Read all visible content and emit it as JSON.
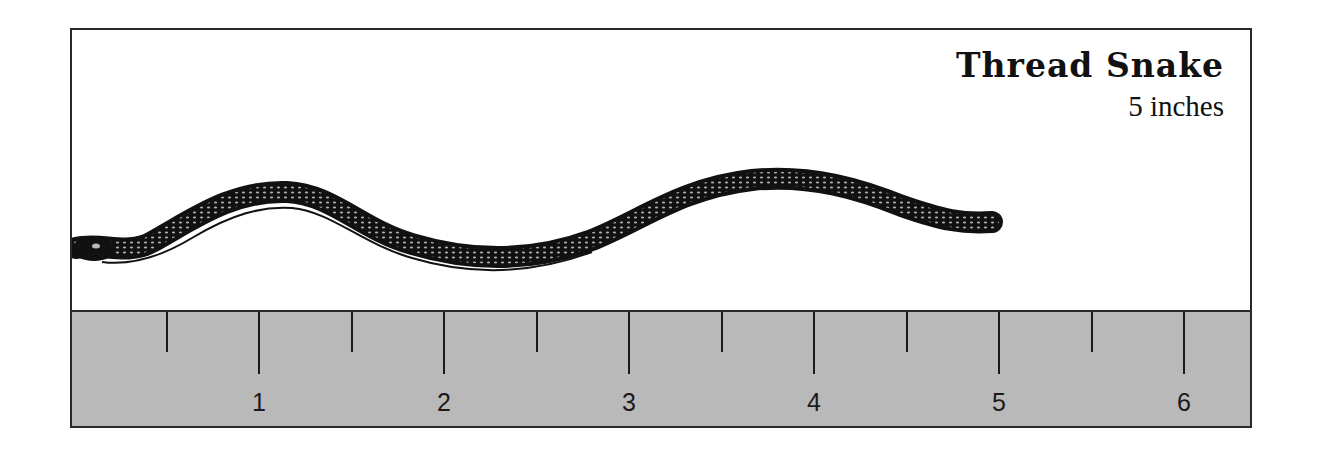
{
  "title": "Thread Snake",
  "subtitle": "5 inches",
  "ruler": {
    "unit": "inches",
    "background_color": "#b9b9b9",
    "px_per_inch": 185,
    "origin_x": 74,
    "ticks": [
      {
        "value": 0.5,
        "type": "minor",
        "label": ""
      },
      {
        "value": 1,
        "type": "major",
        "label": "1"
      },
      {
        "value": 1.5,
        "type": "minor",
        "label": ""
      },
      {
        "value": 2,
        "type": "major",
        "label": "2"
      },
      {
        "value": 2.5,
        "type": "minor",
        "label": ""
      },
      {
        "value": 3,
        "type": "major",
        "label": "3"
      },
      {
        "value": 3.5,
        "type": "minor",
        "label": ""
      },
      {
        "value": 4,
        "type": "major",
        "label": "4"
      },
      {
        "value": 4.5,
        "type": "minor",
        "label": ""
      },
      {
        "value": 5,
        "type": "major",
        "label": "5"
      },
      {
        "value": 5.5,
        "type": "minor",
        "label": ""
      },
      {
        "value": 6,
        "type": "major",
        "label": "6"
      }
    ]
  },
  "illustration": {
    "subject": "thread-snake",
    "length_inches": 5,
    "color": "#111111"
  }
}
